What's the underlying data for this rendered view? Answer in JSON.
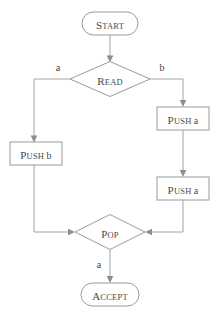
{
  "diagram": {
    "type": "flowchart",
    "title": "",
    "nodes": [
      {
        "id": "start",
        "shape": "stadium",
        "label": "START",
        "label_cap": "S",
        "label_rest": "TART",
        "cx": 110,
        "cy": 23,
        "w": 56,
        "h": 23
      },
      {
        "id": "read",
        "shape": "diamond",
        "label": "READ",
        "label_cap": "R",
        "label_rest": "EAD",
        "cx": 110,
        "cy": 79,
        "w": 80,
        "h": 35
      },
      {
        "id": "push_b",
        "shape": "rect",
        "label": "PUSH b",
        "label_cap": "P",
        "label_rest": "USH ",
        "label_tail": "b",
        "cx": 36,
        "cy": 153,
        "w": 52,
        "h": 23
      },
      {
        "id": "push_a1",
        "shape": "rect",
        "label": "PUSH a",
        "label_cap": "P",
        "label_rest": "USH ",
        "label_tail": "a",
        "cx": 183,
        "cy": 118,
        "w": 52,
        "h": 23
      },
      {
        "id": "push_a2",
        "shape": "rect",
        "label": "PUSH a",
        "label_cap": "P",
        "label_rest": "USH ",
        "label_tail": "a",
        "cx": 183,
        "cy": 188,
        "w": 52,
        "h": 23
      },
      {
        "id": "pop",
        "shape": "diamond",
        "label": "POP",
        "label_cap": "P",
        "label_rest": "OP",
        "cx": 110,
        "cy": 232,
        "w": 70,
        "h": 35
      },
      {
        "id": "accept",
        "shape": "stadium",
        "label": "ACCEPT",
        "label_cap": "A",
        "label_rest": "CCEPT",
        "cx": 110,
        "cy": 294,
        "w": 58,
        "h": 23
      }
    ],
    "edges": [
      {
        "id": "start-read",
        "from": "start",
        "to": "read",
        "label": ""
      },
      {
        "id": "read-push_b",
        "from": "read",
        "to": "push_b",
        "label": "a",
        "label_x": 58,
        "label_y": 68
      },
      {
        "id": "read-push_a1",
        "from": "read",
        "to": "push_a1",
        "label": "b",
        "label_x": 162,
        "label_y": 68
      },
      {
        "id": "push_a1-push_a2",
        "from": "push_a1",
        "to": "push_a2",
        "label": ""
      },
      {
        "id": "push_b-pop",
        "from": "push_b",
        "to": "pop",
        "label": ""
      },
      {
        "id": "push_a2-pop",
        "from": "push_a2",
        "to": "pop",
        "label": ""
      },
      {
        "id": "pop-accept",
        "from": "pop",
        "to": "accept",
        "label": "a",
        "label_x": 99,
        "label_y": 265
      }
    ],
    "colors": {
      "stroke": "#9a9a9a",
      "edge": "#a2a2a2",
      "text": "#4a4a4a",
      "background": "#ffffff"
    }
  }
}
